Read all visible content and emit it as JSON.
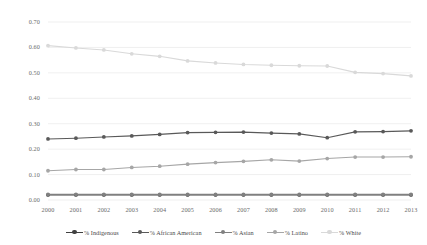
{
  "chart_data": {
    "type": "line",
    "title": "",
    "xlabel": "",
    "ylabel": "",
    "grid": true,
    "legend_position": "bottom",
    "categories": [
      "2000",
      "2001",
      "2002",
      "2003",
      "2004",
      "2005",
      "2006",
      "2007",
      "2008",
      "2009",
      "2010",
      "2011",
      "2012",
      "2013"
    ],
    "x": [
      2000,
      2001,
      2002,
      2003,
      2004,
      2005,
      2006,
      2007,
      2008,
      2009,
      2010,
      2011,
      2012,
      2013
    ],
    "xlim": [
      2000,
      2013
    ],
    "ylim": [
      0.0,
      0.7
    ],
    "yticks": [
      "0.00",
      "0.10",
      "0.20",
      "0.30",
      "0.40",
      "0.50",
      "0.60",
      "0.70"
    ],
    "ytick_values": [
      0.0,
      0.1,
      0.2,
      0.3,
      0.4,
      0.5,
      0.6,
      0.7
    ],
    "series": [
      {
        "name": "% Indigenous",
        "color": "#404040",
        "values": [
          0.02,
          0.02,
          0.02,
          0.02,
          0.02,
          0.02,
          0.02,
          0.02,
          0.02,
          0.02,
          0.02,
          0.02,
          0.02,
          0.02
        ]
      },
      {
        "name": "% African American",
        "color": "#595959",
        "values": [
          0.24,
          0.243,
          0.248,
          0.252,
          0.258,
          0.265,
          0.266,
          0.267,
          0.263,
          0.26,
          0.245,
          0.268,
          0.269,
          0.272
        ]
      },
      {
        "name": "% Asian",
        "color": "#808080",
        "values": [
          0.022,
          0.022,
          0.022,
          0.022,
          0.022,
          0.022,
          0.022,
          0.022,
          0.022,
          0.022,
          0.022,
          0.022,
          0.022,
          0.022
        ]
      },
      {
        "name": "% Latino",
        "color": "#a6a6a6",
        "values": [
          0.115,
          0.12,
          0.12,
          0.128,
          0.133,
          0.141,
          0.147,
          0.152,
          0.158,
          0.153,
          0.163,
          0.169,
          0.169,
          0.17
        ]
      },
      {
        "name": "% White",
        "color": "#d9d9d9",
        "values": [
          0.607,
          0.598,
          0.59,
          0.575,
          0.565,
          0.547,
          0.539,
          0.533,
          0.53,
          0.528,
          0.527,
          0.502,
          0.497,
          0.488
        ]
      }
    ]
  }
}
